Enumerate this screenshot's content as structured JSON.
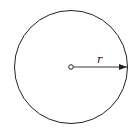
{
  "diagram": {
    "type": "circle-with-radius",
    "radius_label": "r",
    "stroke_color": "#222222",
    "background": "#ffffff"
  }
}
